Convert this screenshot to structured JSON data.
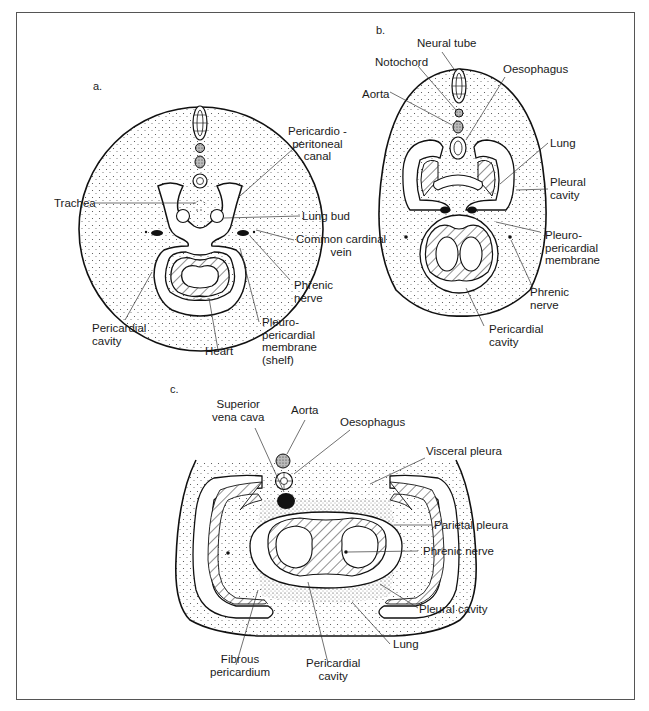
{
  "figure": {
    "panels": [
      {
        "id": "a",
        "letter": "a.",
        "labels": {
          "pericardioperitoneal_canal": [
            "Pericardio -",
            "peritoneal",
            "canal"
          ],
          "trachea": "Trachea",
          "lung_bud": "Lung bud",
          "common_cardinal_vein": [
            "Common cardinal",
            "vein"
          ],
          "phrenic_nerve": [
            "Phrenic",
            "nerve"
          ],
          "pericardial_cavity": [
            "Pericardial",
            "cavity"
          ],
          "heart": "Heart",
          "pleuropericardial_membrane": [
            "Pleuro-",
            "pericardial",
            "membrane",
            "(shelf)"
          ]
        }
      },
      {
        "id": "b",
        "letter": "b.",
        "labels": {
          "neural_tube": "Neural tube",
          "notochord": "Notochord",
          "oesophagus": "Oesophagus",
          "aorta": "Aorta",
          "lung": "Lung",
          "pleural_cavity": [
            "Pleural",
            "cavity"
          ],
          "pleuropericardial_membrane": [
            "Pleuro-",
            "pericardial",
            "membrane"
          ],
          "phrenic_nerve": [
            "Phrenic",
            "nerve"
          ],
          "pericardial_cavity": [
            "Pericardial",
            "cavity"
          ]
        }
      },
      {
        "id": "c",
        "letter": "c.",
        "labels": {
          "superior_vena_cava": [
            "Superior",
            "vena cava"
          ],
          "aorta": "Aorta",
          "oesophagus": "Oesophagus",
          "visceral_pleura": "Visceral pleura",
          "parietal_pleura": "Parietal pleura",
          "phrenic_nerve": "Phrenic nerve",
          "pleural_cavity": "Pleural cavity",
          "lung": "Lung",
          "fibrous_pericardium": [
            "Fibrous",
            "pericardium"
          ],
          "pericardial_cavity": [
            "Pericardial",
            "cavity"
          ]
        }
      }
    ]
  }
}
